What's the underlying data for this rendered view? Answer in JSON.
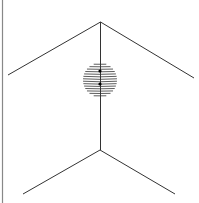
{
  "diagram": {
    "colors": {
      "background": "#ffffff",
      "line": "#333333",
      "border": "#888888",
      "dot": "#000000"
    },
    "border": {
      "x": 2.5,
      "y1": 0,
      "y2": 203
    },
    "vertical_line": {
      "x": 100.5,
      "y1": 22,
      "y2": 150
    },
    "upper_corner": {
      "apex": [
        100.5,
        22
      ],
      "left_end": [
        8,
        75
      ],
      "right_end": [
        194,
        78
      ]
    },
    "lower_corner": {
      "apex": [
        100,
        150
      ],
      "left_end": [
        23,
        194
      ],
      "right_end": [
        175,
        194
      ]
    },
    "sphere": {
      "cx": 100,
      "cy": 80,
      "rx": 17,
      "ry": 17,
      "hatch_lines": 14,
      "dots": [
        [
          100,
          71
        ],
        [
          100,
          84
        ]
      ]
    }
  }
}
